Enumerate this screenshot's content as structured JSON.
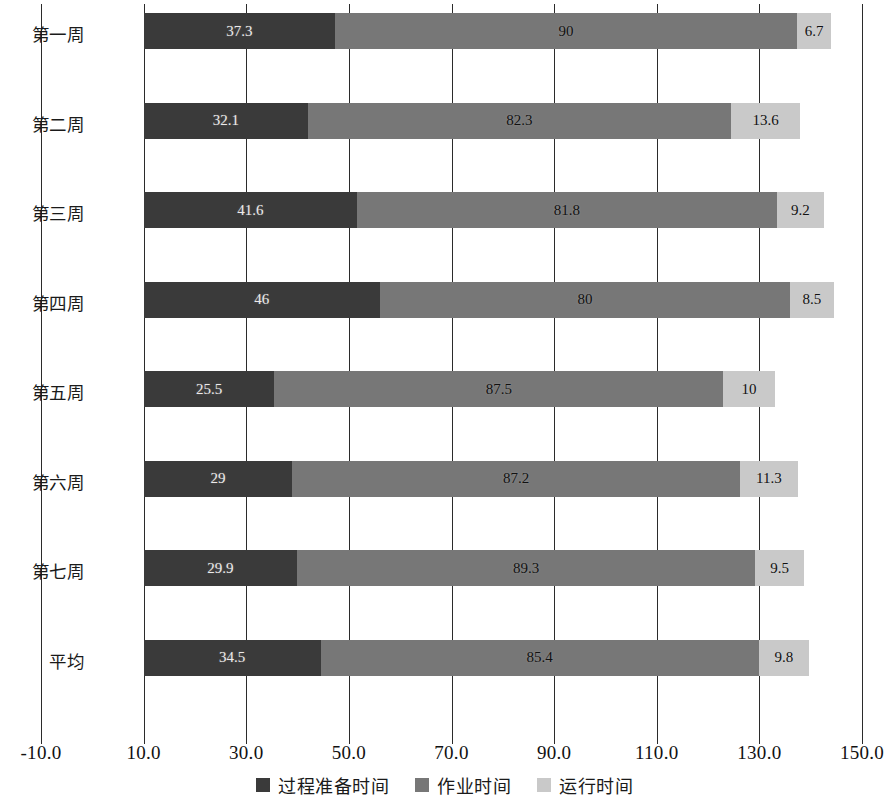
{
  "chart_data": {
    "type": "bar",
    "orientation": "horizontal",
    "stacked": true,
    "title": "",
    "xlabel": "",
    "ylabel": "",
    "categories": [
      "第一周",
      "第二周",
      "第三周",
      "第四周",
      "第五周",
      "第六周",
      "第七周",
      "平均"
    ],
    "series": [
      {
        "name": "过程准备时间",
        "color": "#3a3a3a",
        "values": [
          37.3,
          32.1,
          41.6,
          46,
          25.5,
          29,
          29.9,
          34.5
        ],
        "labels": [
          "37.3",
          "32.1",
          "41.6",
          "46",
          "25.5",
          "29",
          "29.9",
          "34.5"
        ]
      },
      {
        "name": "作业时间",
        "color": "#777777",
        "values": [
          90,
          82.3,
          81.8,
          80,
          87.5,
          87.2,
          89.3,
          85.4
        ],
        "labels": [
          "90",
          "82.3",
          "81.8",
          "80",
          "87.5",
          "87.2",
          "89.3",
          "85.4"
        ]
      },
      {
        "name": "运行时间",
        "color": "#c9c9c9",
        "values": [
          6.7,
          13.6,
          9.2,
          8.5,
          10,
          11.3,
          9.5,
          9.8
        ],
        "labels": [
          "6.7",
          "13.6",
          "9.2",
          "8.5",
          "10",
          "11.3",
          "9.5",
          "9.8"
        ]
      }
    ],
    "bar_start_value": 10,
    "xlim": [
      -10,
      150
    ],
    "xticks": [
      -10,
      10,
      30,
      50,
      70,
      90,
      110,
      130,
      150
    ],
    "xticklabels": [
      "-10.0",
      "10.0",
      "30.0",
      "50.0",
      "70.0",
      "90.0",
      "110.0",
      "130.0",
      "150.0"
    ],
    "grid": true,
    "legend_position": "bottom"
  }
}
